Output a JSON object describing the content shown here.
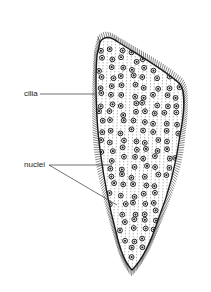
{
  "diagram": {
    "labels": [
      {
        "id": "cilia",
        "text": "cilia",
        "x": 24,
        "y": 90
      },
      {
        "id": "nuclei",
        "text": "nuclei",
        "x": 24,
        "y": 161
      }
    ],
    "colors": {
      "outline": "#1a1a1a",
      "background": "#ffffff",
      "label": "#222222"
    }
  }
}
